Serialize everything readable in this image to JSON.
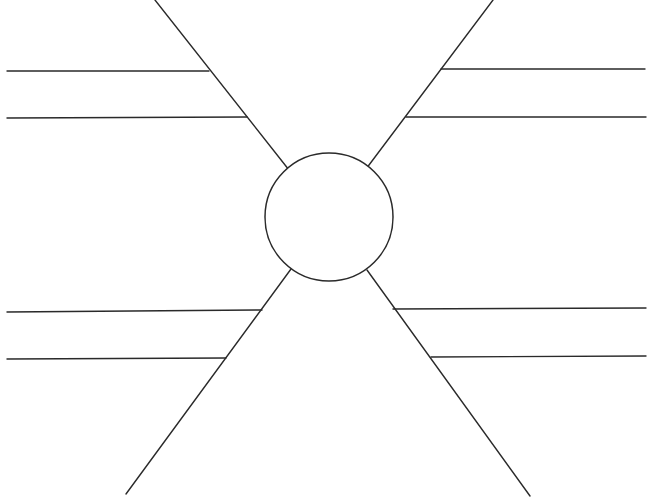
{
  "diagram": {
    "type": "spider-map",
    "canvas": {
      "width": 650,
      "height": 503,
      "background": "#ffffff"
    },
    "stroke_color": "#2a2a2a",
    "hub": {
      "cx": 329,
      "cy": 217,
      "r": 64,
      "label": ""
    },
    "legs": [
      {
        "id": "upper-left",
        "diagonal": {
          "x1": 289,
          "y1": 170,
          "x2": 155,
          "y2": 0
        },
        "branches": [
          {
            "x1": 7,
            "y1": 71,
            "x2": 209,
            "y2": 71,
            "label": ""
          },
          {
            "x1": 7,
            "y1": 118,
            "x2": 247,
            "y2": 117,
            "label": ""
          }
        ]
      },
      {
        "id": "upper-right",
        "diagonal": {
          "x1": 366,
          "y1": 169,
          "x2": 493,
          "y2": 0
        },
        "branches": [
          {
            "x1": 441,
            "y1": 69,
            "x2": 645,
            "y2": 69,
            "label": ""
          },
          {
            "x1": 406,
            "y1": 117,
            "x2": 646,
            "y2": 117,
            "label": ""
          }
        ]
      },
      {
        "id": "lower-left",
        "diagonal": {
          "x1": 291,
          "y1": 269,
          "x2": 126,
          "y2": 494
        },
        "branches": [
          {
            "x1": 7,
            "y1": 312,
            "x2": 262,
            "y2": 310,
            "label": ""
          },
          {
            "x1": 7,
            "y1": 359,
            "x2": 226,
            "y2": 358,
            "label": ""
          }
        ]
      },
      {
        "id": "lower-right",
        "diagonal": {
          "x1": 367,
          "y1": 270,
          "x2": 530,
          "y2": 496
        },
        "branches": [
          {
            "x1": 393,
            "y1": 309,
            "x2": 646,
            "y2": 308,
            "label": ""
          },
          {
            "x1": 431,
            "y1": 357,
            "x2": 646,
            "y2": 356,
            "label": ""
          }
        ]
      }
    ],
    "footer_text_clipped": "(text cut off at bottom edge — illegible)"
  }
}
